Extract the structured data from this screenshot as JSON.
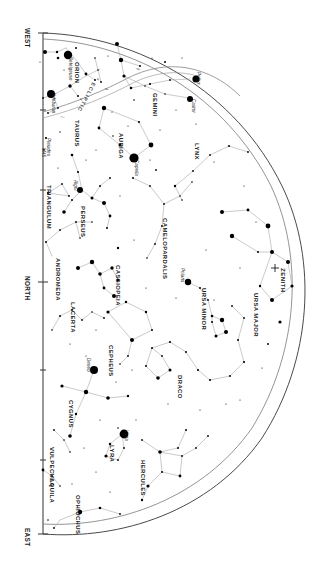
{
  "chart": {
    "orientation_note": "rotated 90 degrees; horizon runs vertically at left",
    "background_color": "#ffffff",
    "star_color": "#000000",
    "constellation_line_color": "#a9a9a9",
    "horizon_color": "#3a3a3a",
    "ecliptic_color": "#8d8d8d"
  },
  "cardinals": [
    {
      "label": "WEST",
      "x": 30,
      "y": 28
    },
    {
      "label": "NORTH",
      "x": 30,
      "y": 276
    },
    {
      "label": "EAST",
      "x": 30,
      "y": 528
    }
  ],
  "zenith": {
    "label": "ZENITH",
    "x": 286,
    "y": 268
  },
  "ecliptic": {
    "label": "ECLIPTIC"
  },
  "constellations": [
    {
      "name": "ORION",
      "x": 79,
      "y": 62
    },
    {
      "name": "TAURUS",
      "x": 79,
      "y": 120
    },
    {
      "name": "GEMINI",
      "x": 157,
      "y": 93
    },
    {
      "name": "AURIGA",
      "x": 123,
      "y": 133
    },
    {
      "name": "LYNX",
      "x": 199,
      "y": 143
    },
    {
      "name": "TRIANGULUM",
      "x": 51,
      "y": 185
    },
    {
      "name": "PERSEUS",
      "x": 85,
      "y": 206
    },
    {
      "name": "ANDROMEDA",
      "x": 60,
      "y": 258
    },
    {
      "name": "CASSIOPEIA",
      "x": 120,
      "y": 265
    },
    {
      "name": "CAMELOPARDALIS",
      "x": 167,
      "y": 218
    },
    {
      "name": "URSA MINOR",
      "x": 206,
      "y": 288
    },
    {
      "name": "URSA MAJOR",
      "x": 258,
      "y": 293
    },
    {
      "name": "LACERTA",
      "x": 75,
      "y": 302
    },
    {
      "name": "CEPHEUS",
      "x": 113,
      "y": 345
    },
    {
      "name": "DRACO",
      "x": 182,
      "y": 375
    },
    {
      "name": "CYGNUS",
      "x": 73,
      "y": 400
    },
    {
      "name": "LYRA",
      "x": 114,
      "y": 445
    },
    {
      "name": "HERCULES",
      "x": 145,
      "y": 460
    },
    {
      "name": "VULPECULA",
      "x": 54,
      "y": 447
    },
    {
      "name": "AQUILA",
      "x": 54,
      "y": 478
    },
    {
      "name": "OPHIUCHUS",
      "x": 80,
      "y": 495
    }
  ],
  "named_stars": [
    {
      "name": "Betelgeuse",
      "x": 68,
      "y": 55,
      "mag_size": 4.2
    },
    {
      "name": "Aldebaran",
      "x": 53,
      "y": 92,
      "mag_size": 4.0
    },
    {
      "name": "Pleiades",
      "x": 50,
      "y": 140,
      "mag_size": 0
    },
    {
      "name": "M45",
      "x": 48,
      "y": 148,
      "mag_size": 0
    },
    {
      "name": "Pollux",
      "x": 196,
      "y": 79,
      "mag_size": 3.6
    },
    {
      "name": "Castor",
      "x": 192,
      "y": 99,
      "mag_size": 3.0
    },
    {
      "name": "Capella",
      "x": 135,
      "y": 158,
      "mag_size": 4.6
    },
    {
      "name": "Algol",
      "x": 80,
      "y": 182,
      "mag_size": 3.0
    },
    {
      "name": "Polaris",
      "x": 186,
      "y": 274,
      "mag_size": 3.2
    },
    {
      "name": "Deneb",
      "x": 94,
      "y": 370,
      "mag_size": 4.0
    },
    {
      "name": "Vega",
      "x": 126,
      "y": 433,
      "mag_size": 4.4
    }
  ],
  "greek_marks": [
    {
      "label": "β",
      "x": 140,
      "y": 68
    },
    {
      "label": "α",
      "x": 100,
      "y": 78
    },
    {
      "label": "δ",
      "x": 108,
      "y": 88
    },
    {
      "label": "α",
      "x": 83,
      "y": 98
    },
    {
      "label": "ζ",
      "x": 64,
      "y": 116
    }
  ]
}
